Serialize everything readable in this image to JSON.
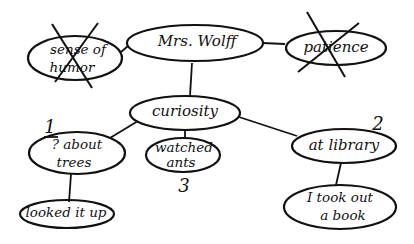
{
  "diagram": {
    "type": "concept-map",
    "style": "hand-drawn",
    "ink_color": "#111111",
    "background": "#ffffff",
    "nodes": {
      "sense_of_humor": {
        "line1": "sense of",
        "line2": "humor",
        "crossed_out": true
      },
      "mrs_wolff": {
        "label": "Mrs. Wolff"
      },
      "patience": {
        "label": "patience",
        "crossed_out": true
      },
      "curiosity": {
        "label": "curiosity"
      },
      "about_trees": {
        "line1": "? about",
        "line2": "trees",
        "order": "1"
      },
      "watched_ants": {
        "line1": "watched",
        "line2": "ants",
        "order": "3"
      },
      "at_library": {
        "label": "at library",
        "order": "2"
      },
      "took_out_book": {
        "line1": "I took out",
        "line2": "a book"
      },
      "looked_it_up": {
        "label": "looked it up"
      }
    },
    "edges": [
      {
        "from": "sense_of_humor",
        "to": "mrs_wolff"
      },
      {
        "from": "mrs_wolff",
        "to": "patience"
      },
      {
        "from": "mrs_wolff",
        "to": "curiosity"
      },
      {
        "from": "curiosity",
        "to": "about_trees"
      },
      {
        "from": "curiosity",
        "to": "watched_ants"
      },
      {
        "from": "curiosity",
        "to": "at_library"
      },
      {
        "from": "about_trees",
        "to": "looked_it_up"
      },
      {
        "from": "at_library",
        "to": "took_out_book"
      }
    ]
  }
}
